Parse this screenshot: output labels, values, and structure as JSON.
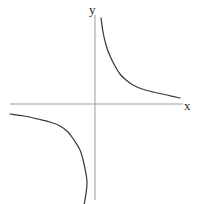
{
  "figure": {
    "background_color": "#ffffff",
    "axis_color": "#9b9b9b",
    "curve_color": "#3a3a3a"
  },
  "labels": {
    "y_axis": "y",
    "x_axis": "x"
  },
  "chart_data": {
    "type": "line",
    "title": "",
    "xlabel": "x",
    "ylabel": "y",
    "grid": false,
    "legend": null,
    "origin_px": {
      "x": 95,
      "y": 104
    },
    "axes_px": {
      "x_axis": {
        "x1": 10,
        "y1": 104,
        "x2": 183,
        "y2": 104
      },
      "y_axis": {
        "x1": 95,
        "y1": 15,
        "x2": 95,
        "y2": 200
      }
    },
    "xlim": [
      -8.5,
      8.8
    ],
    "ylim": [
      -9.6,
      9.2
    ],
    "series": [
      {
        "name": "branch-quadrant-I",
        "quadrant": 1,
        "x": [
          0.55,
          0.7,
          0.9,
          1.2,
          1.6,
          2.1,
          2.8,
          3.6,
          4.6,
          5.8,
          7.2,
          8.6
        ],
        "y": [
          8.9,
          7.0,
          5.4,
          4.1,
          3.1,
          2.3,
          1.75,
          1.35,
          1.06,
          0.84,
          0.68,
          0.57
        ],
        "points_px": [
          [
            101,
            18
          ],
          [
            103,
            32
          ],
          [
            106,
            45
          ],
          [
            110,
            56
          ],
          [
            115,
            66
          ],
          [
            120,
            74
          ],
          [
            126,
            80
          ],
          [
            133,
            85
          ],
          [
            142,
            89
          ],
          [
            153,
            92
          ],
          [
            167,
            95
          ],
          [
            180,
            98
          ]
        ]
      },
      {
        "name": "branch-quadrant-III",
        "quadrant": 3,
        "x": [
          -8.5,
          -7.1,
          -5.7,
          -4.5,
          -3.5,
          -2.7,
          -2.05,
          -1.55,
          -1.15,
          -0.85,
          -0.62,
          -0.5
        ],
        "y": [
          -0.58,
          -0.69,
          -0.86,
          -1.09,
          -1.4,
          -1.82,
          -2.4,
          -3.2,
          -4.3,
          -5.8,
          -8.0,
          -9.6
        ],
        "points_px": [
          [
            10,
            114
          ],
          [
            24,
            116
          ],
          [
            38,
            119
          ],
          [
            50,
            122
          ],
          [
            60,
            126
          ],
          [
            68,
            132
          ],
          [
            74,
            140
          ],
          [
            80,
            150
          ],
          [
            84,
            164
          ],
          [
            87,
            182
          ],
          [
            85,
            200
          ],
          [
            84,
            204
          ]
        ]
      }
    ],
    "asymptotes": [
      "x = 0",
      "y = 0"
    ]
  }
}
